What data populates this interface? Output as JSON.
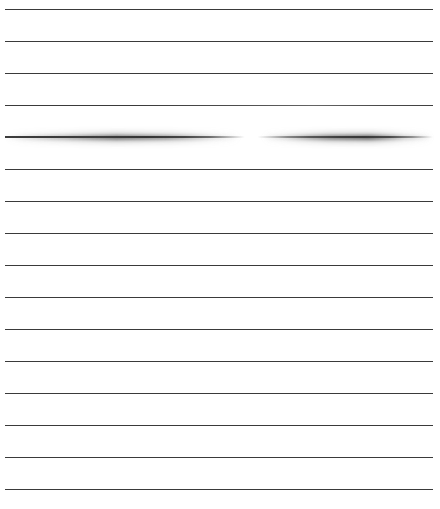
{
  "image": {
    "title": "Ruled horizontal lines with a smudged stroke",
    "width": 440,
    "height": 509,
    "background_color": "#ffffff",
    "line_color": "#3a3a3a",
    "line_count": 16,
    "line_left_px": 5,
    "line_right_px": 433,
    "line_thickness_px": 1.4,
    "first_line_y_px": 9,
    "last_line_y_px": 489,
    "line_spacing_px": 32
  },
  "lines": [
    {
      "index": 1,
      "y": 9,
      "style": "crisp",
      "note": "uniform dark rule"
    },
    {
      "index": 2,
      "y": 41,
      "style": "crisp",
      "note": "uniform dark rule"
    },
    {
      "index": 3,
      "y": 73,
      "style": "crisp",
      "note": "uniform dark rule"
    },
    {
      "index": 4,
      "y": 105,
      "style": "soft",
      "note": "slight fade across right half"
    },
    {
      "index": 5,
      "y": 137,
      "style": "smudge",
      "note": "heavily motion-blurred stroke with a white gap near center"
    },
    {
      "index": 6,
      "y": 169,
      "style": "crisp",
      "note": "uniform dark rule"
    },
    {
      "index": 7,
      "y": 201,
      "style": "crisp",
      "note": "uniform dark rule"
    },
    {
      "index": 8,
      "y": 233,
      "style": "crisp",
      "note": "uniform dark rule"
    },
    {
      "index": 9,
      "y": 265,
      "style": "crisp",
      "note": "uniform dark rule"
    },
    {
      "index": 10,
      "y": 297,
      "style": "crisp",
      "note": "uniform dark rule"
    },
    {
      "index": 11,
      "y": 329,
      "style": "crisp",
      "note": "uniform dark rule"
    },
    {
      "index": 12,
      "y": 361,
      "style": "crisp",
      "note": "uniform dark rule"
    },
    {
      "index": 13,
      "y": 393,
      "style": "crisp",
      "note": "uniform dark rule"
    },
    {
      "index": 14,
      "y": 425,
      "style": "crisp",
      "note": "uniform dark rule"
    },
    {
      "index": 15,
      "y": 457,
      "style": "crisp",
      "note": "uniform dark rule"
    },
    {
      "index": 16,
      "y": 489,
      "style": "crisp",
      "note": "uniform dark rule"
    }
  ],
  "smudge": {
    "y": 137,
    "left_px": 5,
    "right_px": 433,
    "gap_start_px": 222,
    "gap_end_px": 248,
    "max_halo_height_px": 9,
    "description": "Horizontally smeared pencil-like stroke on line 5, darkest around x=120-200 and x=290-390, with a clear white break near the middle."
  }
}
